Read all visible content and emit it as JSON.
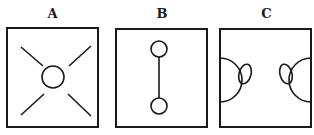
{
  "figure": {
    "panels": [
      {
        "id": "A",
        "label": "A",
        "description": "Square with central circle and four diagonal lines radiating toward corners"
      },
      {
        "id": "B",
        "label": "B",
        "description": "Square with two small circles vertically aligned, connected by a vertical line"
      },
      {
        "id": "C",
        "label": "C",
        "description": "Square with two large semicircles on left and right walls, each with a small oval lobe facing inward"
      }
    ]
  },
  "colors": {
    "stroke": "#1a1a1a",
    "background": "#ffffff"
  }
}
